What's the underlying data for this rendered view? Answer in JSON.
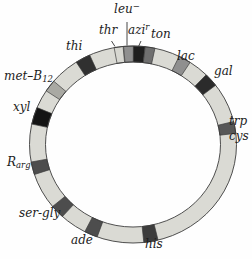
{
  "figure": {
    "kind": "circular-genetic-linkage-map",
    "background": "#fefefe",
    "ring": {
      "fill": "#dadad4",
      "outline": "#3c3c3c",
      "leader_color": "#333333"
    },
    "loci": [
      {
        "id": "thr",
        "base": "thr",
        "angle": -8,
        "span": 5,
        "color": "#d7d7d1",
        "has_tick": true
      },
      {
        "id": "leu",
        "base": "leu",
        "sup": "−",
        "angle": -2.5,
        "span": 5.5,
        "color": "#8f8f8f",
        "has_leader": true
      },
      {
        "id": "azi",
        "base": "azi",
        "sup": "r",
        "angle": 3.5,
        "span": 6.5,
        "color": "#1e1e1e",
        "has_tick": true
      },
      {
        "id": "ton",
        "base": "ton",
        "angle": 9.5,
        "span": 5.5,
        "color": "#6f6f6f"
      },
      {
        "id": "lac",
        "base": "lac",
        "angle": 30,
        "span": 7,
        "color": "#8f8f8f"
      },
      {
        "id": "gal",
        "base": "gal",
        "angle": 49,
        "span": 8,
        "color": "#2b2b2b"
      },
      {
        "id": "trp",
        "base": "trp",
        "angle": 80,
        "span": 7,
        "color": "#575757"
      },
      {
        "id": "cys",
        "base": "cys"
      },
      {
        "id": "his",
        "base": "his",
        "angle": 170,
        "span": 8,
        "color": "#3d3d3d"
      },
      {
        "id": "ade",
        "base": "ade",
        "angle": 204,
        "span": 7.5,
        "color": "#4d4d4d"
      },
      {
        "id": "ser-gly",
        "base": "ser-gly",
        "angle": 227,
        "span": 8,
        "color": "#4d4d4d"
      },
      {
        "id": "R-arg",
        "base": "R",
        "sub": "arg",
        "angle": 256,
        "span": 7.5,
        "color": "#4d4d4d"
      },
      {
        "id": "xyl",
        "base": "xyl",
        "angle": 287,
        "span": 10,
        "color": "#141414"
      },
      {
        "id": "met-B12",
        "base": "met–B",
        "sub": "12",
        "angle": 306.5,
        "span": 7,
        "color": "#a9a9a3"
      },
      {
        "id": "thi",
        "base": "thi",
        "angle": 331,
        "span": 8.5,
        "color": "#303030"
      }
    ]
  }
}
